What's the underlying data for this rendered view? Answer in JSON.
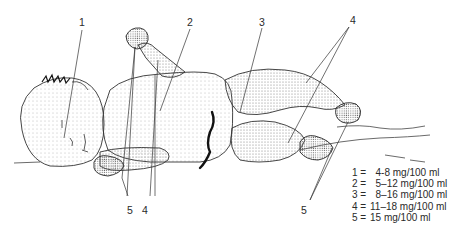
{
  "figure": {
    "colors": {
      "ink": "#2a2a2a",
      "stipple": "#6a6a6a",
      "background": "#ffffff"
    }
  },
  "callouts": [
    {
      "id": "1",
      "label": "1"
    },
    {
      "id": "2",
      "label": "2"
    },
    {
      "id": "3",
      "label": "3"
    },
    {
      "id": "4",
      "label": "4"
    },
    {
      "id": "5",
      "label": "5"
    },
    {
      "id": "4b",
      "label": "4"
    },
    {
      "id": "5b",
      "label": "5"
    }
  ],
  "legend": [
    {
      "key": "1 =",
      "value": "  4-8 mg/100 ml"
    },
    {
      "key": "2 =",
      "value": "  5–12 mg/100 ml"
    },
    {
      "key": "3 =",
      "value": "  8–16 mg/100 ml"
    },
    {
      "key": "4 =",
      "value": "11–18 mg/100 ml"
    },
    {
      "key": "5 =",
      "value": "15 mg/100 ml"
    }
  ]
}
